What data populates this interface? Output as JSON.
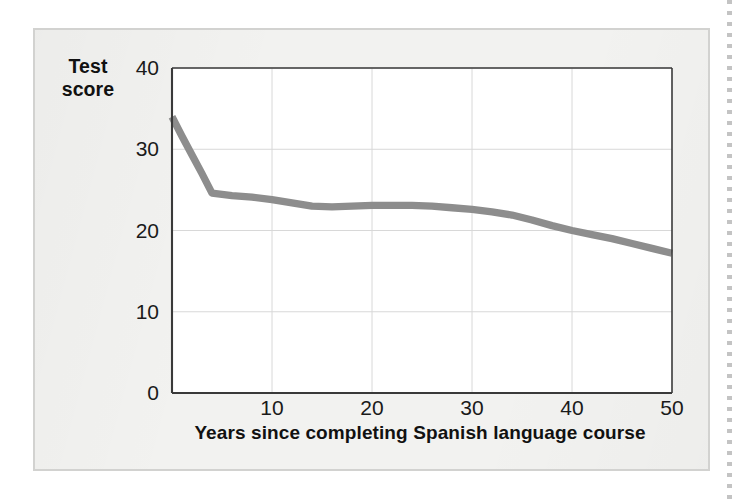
{
  "figure": {
    "y_axis_title_line1": "Test",
    "y_axis_title_line2": "score",
    "x_axis_title": "Years since completing Spanish language course"
  },
  "colors": {
    "panel_background": "#f2f2f0",
    "panel_border": "#d2d2d0",
    "plot_background": "#ffffff",
    "axis_line": "#3a3a3a",
    "gridline": "#d8d8d8",
    "series_line": "#8d8d8d",
    "text": "#111111"
  },
  "chart_data": {
    "type": "line",
    "title": "",
    "subtitle": "",
    "xlabel": "Years since completing Spanish language course",
    "ylabel": "Test score",
    "xlim": [
      0,
      50
    ],
    "ylim": [
      0,
      40
    ],
    "xticks": [
      10,
      20,
      30,
      40,
      50
    ],
    "xtick_labels": [
      "10",
      "20",
      "30",
      "40",
      "50"
    ],
    "yticks": [
      0,
      10,
      20,
      30,
      40
    ],
    "ytick_labels": [
      "0",
      "10",
      "20",
      "30",
      "40"
    ],
    "grid": "horizontal-and-vertical",
    "legend": "none",
    "annotations": [],
    "series": [
      {
        "name": "Test score",
        "color": "#8d8d8d",
        "line_width_units": 0.9,
        "x": [
          0,
          1,
          2,
          3,
          4,
          6,
          8,
          10,
          12,
          14,
          16,
          18,
          20,
          22,
          24,
          26,
          28,
          30,
          32,
          34,
          36,
          38,
          40,
          42,
          44,
          46,
          48,
          50
        ],
        "y": [
          34.0,
          31.6,
          29.3,
          27.0,
          24.6,
          24.3,
          24.1,
          23.8,
          23.4,
          23.0,
          22.9,
          23.0,
          23.1,
          23.1,
          23.1,
          23.0,
          22.8,
          22.6,
          22.3,
          21.9,
          21.3,
          20.6,
          20.0,
          19.5,
          19.0,
          18.4,
          17.8,
          17.2
        ]
      }
    ]
  }
}
